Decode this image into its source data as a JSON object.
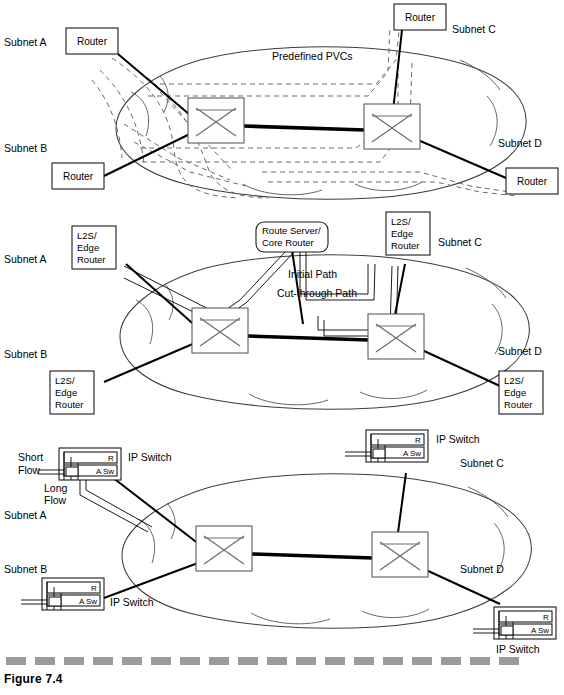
{
  "figure": {
    "caption": "Figure 7.4"
  },
  "panels": [
    {
      "id": "panel-pvc",
      "name": "predefined-pvc-network",
      "cloud_label": "Predefined PVCs",
      "subnets": [
        {
          "key": "a",
          "label": "Subnet A"
        },
        {
          "key": "b",
          "label": "Subnet B"
        },
        {
          "key": "c",
          "label": "Subnet C"
        },
        {
          "key": "d",
          "label": "Subnet D"
        }
      ],
      "nodes": [
        {
          "key": "router-a",
          "label": "Router",
          "type": "router"
        },
        {
          "key": "router-b",
          "label": "Router",
          "type": "router"
        },
        {
          "key": "router-c",
          "label": "Router",
          "type": "router"
        },
        {
          "key": "router-d",
          "label": "Router",
          "type": "router"
        },
        {
          "key": "atm-switch-left",
          "label": "",
          "type": "atm-switch"
        },
        {
          "key": "atm-switch-right",
          "label": "",
          "type": "atm-switch"
        }
      ]
    },
    {
      "id": "panel-mpoa",
      "name": "route-server-cut-through-network",
      "route_server": {
        "line1": "Route Server/",
        "line2": "Core Router"
      },
      "path_labels": {
        "initial": "Initial Path",
        "cut_through": "Cut-through Path"
      },
      "subnets": [
        {
          "key": "a",
          "label": "Subnet A"
        },
        {
          "key": "b",
          "label": "Subnet B"
        },
        {
          "key": "c",
          "label": "Subnet C"
        },
        {
          "key": "d",
          "label": "Subnet D"
        }
      ],
      "nodes": [
        {
          "key": "edge-a",
          "line1": "L2S/",
          "line2": "Edge",
          "line3": "Router",
          "type": "edge-router"
        },
        {
          "key": "edge-b",
          "line1": "L2S/",
          "line2": "Edge",
          "line3": "Router",
          "type": "edge-router"
        },
        {
          "key": "edge-c",
          "line1": "L2S/",
          "line2": "Edge",
          "line3": "Router",
          "type": "edge-router"
        },
        {
          "key": "edge-d",
          "line1": "L2S/",
          "line2": "Edge",
          "line3": "Router",
          "type": "edge-router"
        },
        {
          "key": "atm-switch-left",
          "label": "",
          "type": "atm-switch"
        },
        {
          "key": "atm-switch-right",
          "label": "",
          "type": "atm-switch"
        }
      ]
    },
    {
      "id": "panel-ipswitch",
      "name": "ip-switching-network",
      "flow_labels": {
        "short_line1": "Short",
        "short_line2": "Flow",
        "long_line1": "Long",
        "long_line2": "Flow"
      },
      "subnets": [
        {
          "key": "a",
          "label": "Subnet A"
        },
        {
          "key": "b",
          "label": "Subnet B"
        },
        {
          "key": "c",
          "label": "Subnet C"
        },
        {
          "key": "d",
          "label": "Subnet D"
        }
      ],
      "nodes": [
        {
          "key": "ipsw-a",
          "label": "IP Switch",
          "router_tag": "R",
          "switch_tag": "A Sw",
          "type": "ip-switch"
        },
        {
          "key": "ipsw-b",
          "label": "IP Switch",
          "router_tag": "R",
          "switch_tag": "A Sw",
          "type": "ip-switch"
        },
        {
          "key": "ipsw-c",
          "label": "IP Switch",
          "router_tag": "R",
          "switch_tag": "A Sw",
          "type": "ip-switch"
        },
        {
          "key": "ipsw-d",
          "label": "IP Switch",
          "router_tag": "R",
          "switch_tag": "A Sw",
          "type": "ip-switch"
        },
        {
          "key": "atm-switch-left",
          "label": "",
          "type": "atm-switch"
        },
        {
          "key": "atm-switch-right",
          "label": "",
          "type": "atm-switch"
        }
      ]
    }
  ],
  "colors": {
    "ink": "#000000",
    "cloud_stroke": "#3d3d3d",
    "box_stroke": "#5b5b5b",
    "rule": "#9b9b9b"
  }
}
